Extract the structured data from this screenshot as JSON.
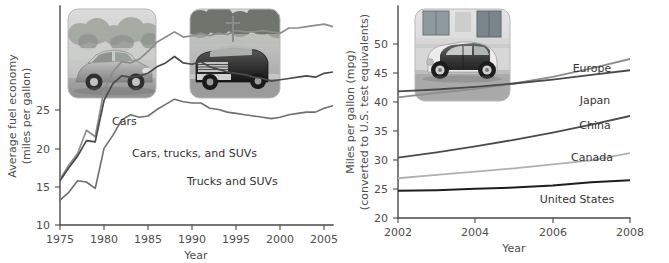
{
  "figure": {
    "background_color": "#ffffff",
    "panels": [
      "left-chart",
      "right-chart"
    ]
  },
  "chart_data": [
    {
      "id": "us-average-fuel-economy",
      "type": "line",
      "title": "",
      "xlabel": "Year",
      "ylabel": "Average fuel economy\n(miles per gallon)",
      "ylabel_line1": "Average fuel economy",
      "ylabel_line2": "(miles per gallon)",
      "xlim": [
        1975,
        2006
      ],
      "ylim": [
        9.5,
        26.5
      ],
      "xticks": [
        1975,
        1980,
        1985,
        1990,
        1995,
        2000,
        2005
      ],
      "yticks": [
        10,
        15,
        20,
        25
      ],
      "grid": false,
      "legend_position": "inline-annotations",
      "x": [
        1975,
        1976,
        1977,
        1978,
        1979,
        1980,
        1981,
        1982,
        1983,
        1984,
        1985,
        1986,
        1987,
        1988,
        1989,
        1990,
        1991,
        1992,
        1993,
        1994,
        1995,
        1996,
        1997,
        1998,
        1999,
        2000,
        2001,
        2002,
        2003,
        2004,
        2005,
        2006
      ],
      "series": [
        {
          "name": "Cars",
          "color": "#8c8c8c",
          "values": [
            13.1,
            14.2,
            15.1,
            16.9,
            16.4,
            20.0,
            21.4,
            22.2,
            22.1,
            22.4,
            23.0,
            23.7,
            24.1,
            24.5,
            24.1,
            24.2,
            24.4,
            24.2,
            24.4,
            24.3,
            24.6,
            24.5,
            24.5,
            24.6,
            24.5,
            24.4,
            24.8,
            24.8,
            24.9,
            25.0,
            25.1,
            24.9
          ]
        },
        {
          "name": "Cars, trucks, and SUVs",
          "color": "#4a4a4a",
          "values": [
            13.0,
            14.0,
            14.9,
            16.1,
            16.0,
            19.2,
            20.5,
            21.1,
            21.0,
            21.1,
            21.3,
            21.8,
            22.1,
            22.6,
            22.1,
            22.0,
            22.2,
            21.8,
            21.6,
            21.4,
            21.3,
            21.2,
            21.0,
            20.9,
            20.7,
            20.8,
            20.9,
            21.0,
            21.1,
            21.0,
            21.3,
            21.4
          ]
        },
        {
          "name": "Trucks and SUVs",
          "color": "#6f6f6f",
          "values": [
            11.5,
            12.1,
            13.0,
            12.9,
            12.4,
            15.5,
            16.5,
            17.7,
            18.1,
            17.9,
            18.0,
            18.5,
            18.9,
            19.3,
            19.1,
            19.0,
            19.0,
            18.6,
            18.5,
            18.3,
            18.2,
            18.1,
            18.0,
            17.9,
            17.8,
            17.9,
            18.1,
            18.2,
            18.3,
            18.3,
            18.6,
            18.8
          ]
        }
      ],
      "annotations": [
        {
          "text": "Cars",
          "x": 1984.0,
          "y": 24.2
        },
        {
          "text": "Cars, trucks, and SUVs",
          "x": 1986.5,
          "y": 20.6
        },
        {
          "text": "Trucks and SUVs",
          "x": 1992.0,
          "y": 17.3
        }
      ],
      "images": [
        {
          "name": "sedan-car-photo",
          "alt": "Gray sedan car on a road"
        },
        {
          "name": "pickup-truck-photo",
          "alt": "Dark pickup truck on a road"
        }
      ]
    },
    {
      "id": "international-fuel-economy-standards",
      "type": "line",
      "title": "",
      "xlabel": "Year",
      "ylabel": "Miles per gallon (mpg)\n(converted to U.S. test equivalents)",
      "ylabel_line1": "Miles per gallon (mpg)",
      "ylabel_line2": "(converted to U.S. test equivalents)",
      "xlim": [
        2002,
        2008
      ],
      "ylim": [
        20,
        52
      ],
      "xticks": [
        2002,
        2004,
        2006,
        2008
      ],
      "yticks": [
        20,
        25,
        30,
        35,
        40,
        45,
        50
      ],
      "grid": false,
      "legend_position": "right-end-labels",
      "x": [
        2002,
        2003,
        2004,
        2005,
        2006,
        2007,
        2008
      ],
      "series": [
        {
          "name": "Europe",
          "color": "#8c8c8c",
          "values": [
            38.2,
            38.9,
            39.5,
            40.3,
            41.3,
            42.6,
            44.0
          ]
        },
        {
          "name": "Japan",
          "color": "#4a4a4a",
          "values": [
            39.1,
            39.4,
            39.8,
            40.3,
            40.9,
            41.6,
            42.3
          ]
        },
        {
          "name": "China",
          "color": "#4a4a4a",
          "values": [
            29.1,
            29.9,
            30.8,
            31.8,
            32.9,
            34.1,
            35.4
          ]
        },
        {
          "name": "Canada",
          "color": "#b0b0b0",
          "values": [
            26.0,
            26.5,
            27.0,
            27.5,
            28.1,
            28.7,
            29.8
          ]
        },
        {
          "name": "United States",
          "color": "#1e1e1e",
          "values": [
            24.1,
            24.2,
            24.4,
            24.6,
            24.9,
            25.4,
            25.7
          ]
        }
      ],
      "annotations": [
        {
          "text": "Europe",
          "x": 2007.1,
          "y": 45.2
        },
        {
          "text": "Japan",
          "x": 2007.3,
          "y": 40.6
        },
        {
          "text": "China",
          "x": 2007.3,
          "y": 36.6
        },
        {
          "text": "Canada",
          "x": 2007.1,
          "y": 31.2
        },
        {
          "text": "United States",
          "x": 2006.3,
          "y": 23.2
        }
      ],
      "images": [
        {
          "name": "smart-car-photo",
          "alt": "Small Smart car parked by a building"
        }
      ]
    }
  ]
}
